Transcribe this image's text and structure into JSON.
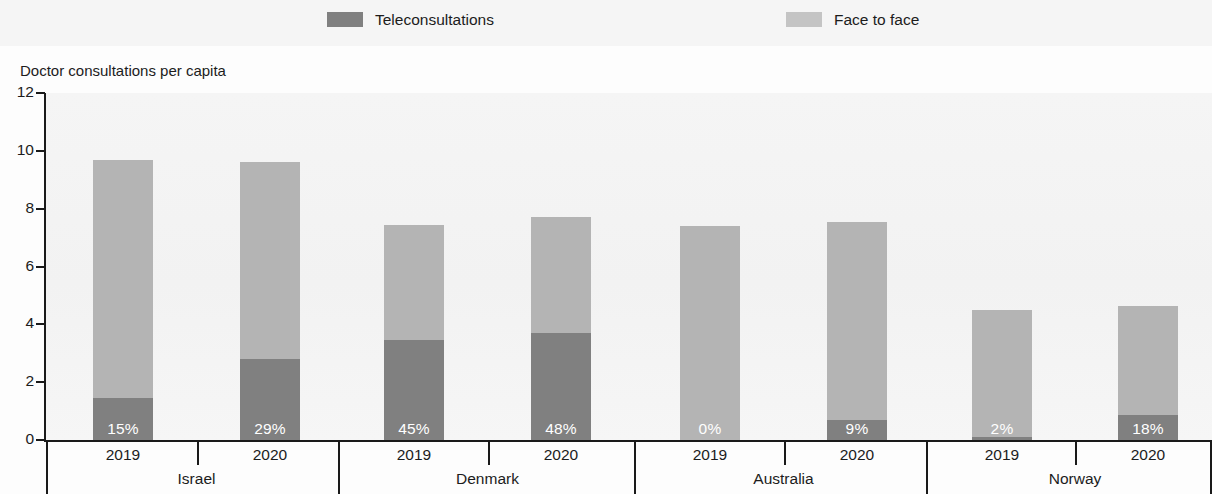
{
  "legend": {
    "items": [
      {
        "label": "Teleconsultations",
        "color": "#808080",
        "key": "tele"
      },
      {
        "label": "Face to face",
        "color": "#b4b4b4",
        "key": "f2f"
      }
    ]
  },
  "axis": {
    "y_title": "Doctor consultations per capita",
    "y_ticks": [
      "12",
      "10",
      "8",
      "6",
      "4",
      "2",
      "0"
    ]
  },
  "chart_data": {
    "type": "bar",
    "subtype": "stacked-bar",
    "title": "",
    "subtitle": "",
    "xlabel": "",
    "ylabel": "Doctor consultations per capita",
    "ylim": [
      0,
      12
    ],
    "ytick_values": [
      0,
      2,
      4,
      6,
      8,
      10,
      12
    ],
    "grid": false,
    "legend_position": "top-center",
    "stacked": true,
    "groups": [
      "Israel",
      "Denmark",
      "Australia",
      "Norway"
    ],
    "categories": [
      "Israel 2019",
      "Israel 2020",
      "Denmark 2019",
      "Denmark 2020",
      "Australia 2019",
      "Australia 2020",
      "Norway 2019",
      "Norway 2020"
    ],
    "series": [
      {
        "name": "Teleconsultations",
        "color": "#808080",
        "values": [
          1.45,
          2.8,
          3.45,
          3.7,
          0.0,
          0.7,
          0.09,
          0.85
        ]
      },
      {
        "name": "Face to face",
        "color": "#b4b4b4",
        "values": [
          8.25,
          6.8,
          4.0,
          4.0,
          7.4,
          6.85,
          4.41,
          3.8
        ]
      }
    ],
    "totals": [
      9.7,
      9.6,
      7.45,
      7.7,
      7.4,
      7.55,
      4.5,
      4.65
    ],
    "annotations": [
      "15%",
      "29%",
      "45%",
      "48%",
      "0%",
      "9%",
      "2%",
      "18%"
    ]
  },
  "bars": [
    {
      "group": "Israel",
      "year": "2019",
      "total": 9.7,
      "tele": 1.45,
      "pct": "15%"
    },
    {
      "group": "Israel",
      "year": "2020",
      "total": 9.6,
      "tele": 2.8,
      "pct": "29%"
    },
    {
      "group": "Denmark",
      "year": "2019",
      "total": 7.45,
      "tele": 3.45,
      "pct": "45%"
    },
    {
      "group": "Denmark",
      "year": "2020",
      "total": 7.7,
      "tele": 3.7,
      "pct": "48%"
    },
    {
      "group": "Australia",
      "year": "2019",
      "total": 7.4,
      "tele": 0.0,
      "pct": "0%"
    },
    {
      "group": "Australia",
      "year": "2020",
      "total": 7.55,
      "tele": 0.7,
      "pct": "9%"
    },
    {
      "group": "Norway",
      "year": "2019",
      "total": 4.5,
      "tele": 0.09,
      "pct": "2%"
    },
    {
      "group": "Norway",
      "year": "2020",
      "total": 4.65,
      "tele": 0.85,
      "pct": "18%"
    }
  ]
}
